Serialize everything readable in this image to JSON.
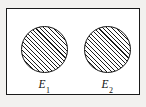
{
  "figure": {
    "type": "venn-diagram",
    "sample_space": {
      "shape": "rectangle",
      "fill": "#ffffff",
      "border_color": "#1a1a1a",
      "label": ""
    },
    "hatch": {
      "style": "diagonal-45",
      "color": "#1b1b1b",
      "spacing_px": 3
    },
    "events": [
      {
        "id": "E1",
        "label_base": "E",
        "label_sub": "1",
        "shape": "circle",
        "fill": "hatched",
        "center_x": 45,
        "center_y": 50,
        "radius": 23
      },
      {
        "id": "E2",
        "label_base": "E",
        "label_sub": "2",
        "shape": "circle",
        "fill": "hatched",
        "center_x": 108,
        "center_y": 50,
        "radius": 23
      }
    ]
  }
}
